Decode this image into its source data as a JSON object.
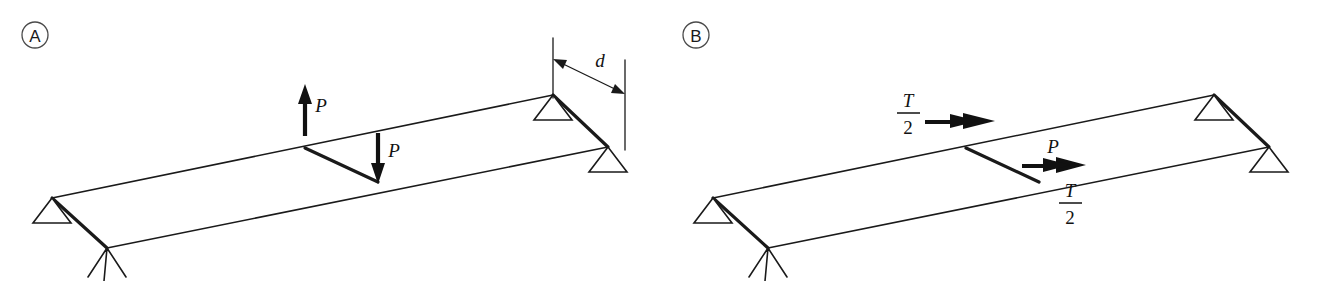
{
  "figure": {
    "background_color": "#ffffff",
    "line_color": "#1a1a1a"
  },
  "panels": [
    {
      "id": "panel-a",
      "label": "A",
      "label_center": {
        "x": 35,
        "y": 35,
        "r": 13
      },
      "plate": {
        "back_left": {
          "x": 52,
          "y": 198
        },
        "back_right": {
          "x": 553,
          "y": 95
        },
        "front_right": {
          "x": 608,
          "y": 147
        },
        "front_left": {
          "x": 107,
          "y": 248
        }
      },
      "crack": {
        "x1": 305,
        "y1": 148,
        "x2": 378,
        "y2": 182
      },
      "supports": [
        {
          "name": "pin-support-back-left",
          "apex_x": 52,
          "apex_y": 198,
          "half_width": 19,
          "height": 25
        },
        {
          "name": "pin-support-front-left",
          "apex_x": 107,
          "apex_y": 248,
          "type": "x-mark"
        },
        {
          "name": "pin-support-back-right",
          "apex_x": 553,
          "apex_y": 95,
          "half_width": 19,
          "height": 25
        },
        {
          "name": "pin-support-front-right",
          "apex_x": 608,
          "apex_y": 147,
          "half_width": 19,
          "height": 25
        }
      ],
      "forces": [
        {
          "name": "force-up",
          "label": "P",
          "direction": "up",
          "x": 305,
          "y_tail": 135,
          "y_tip": 85,
          "label_x": 320,
          "label_y": 104
        },
        {
          "name": "force-down",
          "label": "P",
          "direction": "down",
          "x": 378,
          "y_tail": 133,
          "y_tip": 182,
          "label_x": 393,
          "label_y": 150
        }
      ],
      "dimension": {
        "name": "dimension-d",
        "label": "d",
        "label_x": 600,
        "label_y": 62,
        "ext_left": {
          "x": 553,
          "y_top": 38,
          "y_bot": 98
        },
        "ext_right": {
          "x": 625,
          "y_top": 62,
          "y_bot": 150
        },
        "arrow": {
          "x1": 558,
          "y1": 62,
          "x2": 621,
          "y2": 93
        }
      }
    },
    {
      "id": "panel-b",
      "label": "B",
      "label_center": {
        "x": 696,
        "y": 35,
        "r": 13
      },
      "plate": {
        "back_left": {
          "x": 713,
          "y": 198
        },
        "back_right": {
          "x": 1214,
          "y": 95
        },
        "front_right": {
          "x": 1269,
          "y": 147
        },
        "front_left": {
          "x": 768,
          "y": 248
        }
      },
      "crack": {
        "x1": 966,
        "y1": 148,
        "x2": 1039,
        "y2": 182
      },
      "supports": [
        {
          "name": "pin-support-back-left",
          "apex_x": 713,
          "apex_y": 198,
          "half_width": 19,
          "height": 25
        },
        {
          "name": "pin-support-front-left",
          "apex_x": 768,
          "apex_y": 248,
          "type": "x-mark"
        },
        {
          "name": "pin-support-back-right",
          "apex_x": 1214,
          "apex_y": 95,
          "half_width": 19,
          "height": 25
        },
        {
          "name": "pin-support-front-right",
          "apex_x": 1269,
          "apex_y": 147,
          "half_width": 19,
          "height": 25
        }
      ],
      "forces": [
        {
          "name": "torque-upper",
          "label_num": "T",
          "label_den": "2",
          "direction": "right",
          "x_tail": 925,
          "x_tip": 992,
          "y": 122,
          "label_x": 908,
          "label_y": 112
        },
        {
          "name": "force-p",
          "label": "P",
          "direction": "right",
          "x_tail": 1022,
          "x_tip": 1083,
          "y": 166,
          "label_x": 1053,
          "label_y": 146
        },
        {
          "name": "torque-lower",
          "label_num": "T",
          "label_den": "2",
          "direction": "right",
          "label_x": 1070,
          "label_y": 202
        }
      ]
    }
  ],
  "symbols": {
    "force_label": "P",
    "torque_numerator": "T",
    "torque_denominator": "2",
    "distance_label": "d"
  }
}
